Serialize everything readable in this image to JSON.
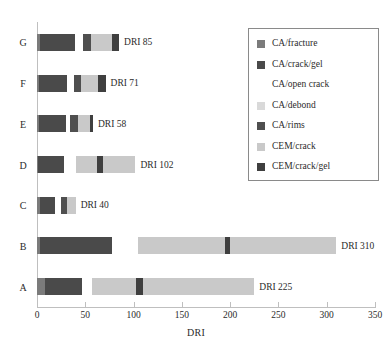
{
  "chart_data": {
    "type": "bar",
    "orientation": "horizontal",
    "stacked": true,
    "title": "",
    "xlabel": "DRI",
    "ylabel": "",
    "xlim": [
      0,
      350
    ],
    "xticks": [
      0,
      50,
      100,
      150,
      200,
      250,
      300,
      350
    ],
    "xtick_labels": [
      "0",
      "50",
      "100",
      "150",
      "200",
      "250",
      "300",
      "350"
    ],
    "grid": false,
    "legend_position": "right-top",
    "categories": [
      "G",
      "F",
      "E",
      "D",
      "C",
      "B",
      "A"
    ],
    "series": [
      {
        "name": "CA/fracture",
        "color": "#7b7b7b",
        "values": [
          3,
          2,
          2,
          1,
          3,
          3,
          8
        ]
      },
      {
        "name": "CA/crack/gel",
        "color": "#4a4a4a",
        "values": [
          36,
          29,
          28,
          27,
          16,
          75,
          39
        ]
      },
      {
        "name": "CA/open crack",
        "color": "#ffffff",
        "values": [
          9,
          7,
          4,
          12,
          6,
          27,
          10
        ]
      },
      {
        "name": "CA/debond",
        "color": "#d9d9d9",
        "values": [
          0,
          0,
          0,
          0,
          0,
          0,
          0
        ]
      },
      {
        "name": "CA/rims",
        "color": "#4f4f4f",
        "values": [
          8,
          8,
          8,
          0,
          6,
          0,
          0
        ]
      },
      {
        "name": "CEM/crack",
        "color": "#c9c9c9",
        "values": [
          22,
          17,
          13,
          22,
          9,
          90,
          46
        ]
      },
      {
        "name": "CEM/crack/gel",
        "color": "#3f3f3f",
        "values": [
          7,
          8,
          3,
          6,
          0,
          5,
          7
        ]
      },
      {
        "name": "CEM/crack (2)",
        "color": "#c9c9c9",
        "values": [
          0,
          0,
          0,
          34,
          0,
          110,
          115
        ]
      }
    ],
    "bar_totals": [
      85,
      71,
      58,
      102,
      40,
      310,
      225
    ],
    "bar_total_labels": [
      "DRI 85",
      "DRI 71",
      "DRI 58",
      "DRI 102",
      "DRI 40",
      "DRI 310",
      "DRI 225"
    ]
  },
  "legend": {
    "entries": [
      {
        "label": "CA/fracture",
        "color": "#7b7b7b"
      },
      {
        "label": "CA/crack/gel",
        "color": "#4a4a4a"
      },
      {
        "label": "CA/open crack",
        "color": "#ffffff"
      },
      {
        "label": "CA/debond",
        "color": "#d9d9d9"
      },
      {
        "label": "CA/rims",
        "color": "#4f4f4f"
      },
      {
        "label": "CEM/crack",
        "color": "#c9c9c9"
      },
      {
        "label": "CEM/crack/gel",
        "color": "#3f3f3f"
      }
    ]
  },
  "axes": {
    "x_title": "DRI",
    "axis_color": "#bfbfbf"
  }
}
